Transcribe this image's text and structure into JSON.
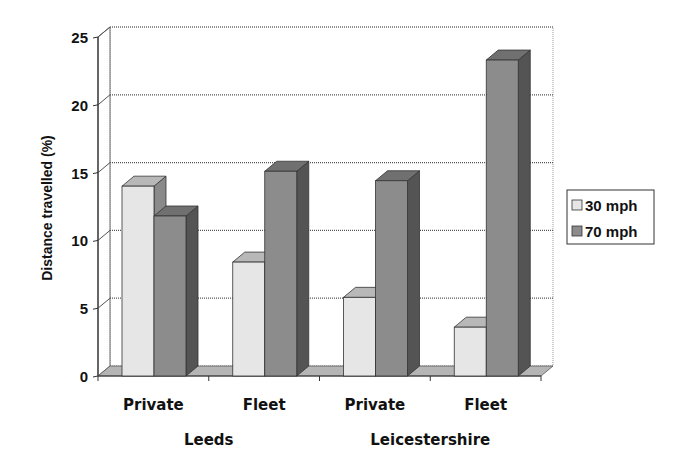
{
  "chart_data": {
    "type": "bar",
    "style": "3d-clustered-column",
    "title": "",
    "categories": [
      "Private",
      "Fleet",
      "Private",
      "Fleet"
    ],
    "category_groups": [
      {
        "label": "Leeds",
        "categories": [
          "Private",
          "Fleet"
        ]
      },
      {
        "label": "Leicestershire",
        "categories": [
          "Private",
          "Fleet"
        ]
      }
    ],
    "series": [
      {
        "name": "30 mph",
        "color": "#e6e6e6",
        "values": [
          14.0,
          8.4,
          5.8,
          3.6
        ]
      },
      {
        "name": "70 mph",
        "color": "#8c8c8c",
        "values": [
          11.8,
          15.1,
          14.4,
          23.3
        ]
      }
    ],
    "xlabel": "",
    "ylabel": "Distance travelled (%)",
    "ylim": [
      0,
      25
    ],
    "yticks": [
      0,
      5,
      10,
      15,
      20,
      25
    ],
    "grid": true,
    "legend_position": "right"
  },
  "legend": {
    "items": [
      {
        "label": "30 mph",
        "color": "#e6e6e6"
      },
      {
        "label": "70 mph",
        "color": "#8c8c8c"
      }
    ]
  }
}
